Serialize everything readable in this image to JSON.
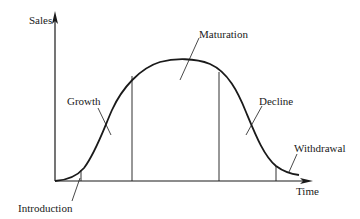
{
  "diagram": {
    "type": "product-life-cycle",
    "axes": {
      "y_label": "Sales",
      "x_label": "Time"
    },
    "stages": [
      {
        "label": "Introduction"
      },
      {
        "label": "Growth"
      },
      {
        "label": "Maturation"
      },
      {
        "label": "Decline"
      },
      {
        "label": "Withdrawal"
      }
    ],
    "colors": {
      "line": "#1a1a1a",
      "background": "#ffffff"
    }
  }
}
